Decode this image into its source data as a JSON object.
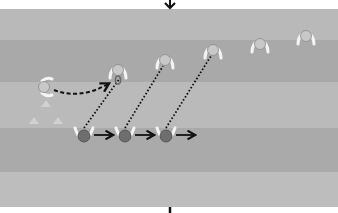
{
  "diagram": {
    "type": "sports-drill",
    "background": "#ffffff",
    "field": {
      "x": 0,
      "y": 9,
      "width": 338,
      "height": 198,
      "stripes": [
        {
          "y": 9,
          "h": 31,
          "color": "#b9b9b9"
        },
        {
          "y": 40,
          "h": 42,
          "color": "#a9a9a9"
        },
        {
          "y": 82,
          "h": 46,
          "color": "#bababa"
        },
        {
          "y": 128,
          "h": 44,
          "color": "#aaaaaa"
        },
        {
          "y": 172,
          "h": 35,
          "color": "#bdbdbd"
        }
      ]
    },
    "colors": {
      "light_player": "#c8c8c8",
      "light_player_stroke": "#8a8a8a",
      "dark_player": "#6e6e6e",
      "dark_player_stroke": "#4a4a4a",
      "arm": "#f4f4f4",
      "ball": "#6a6a6a",
      "line": "#111111",
      "cone": "#d4d4d4"
    },
    "direction_arrow_top": {
      "icon": "arrow-down-icon",
      "x": 170,
      "y1": 0,
      "y2": 9
    },
    "direction_marker_bottom": {
      "icon": "bar-marker-icon",
      "x": 170,
      "y1": 207,
      "y2": 213
    },
    "light_players": [
      {
        "id": "passer",
        "x": 44,
        "y": 87,
        "facing": "right"
      },
      {
        "id": "receiver-ball",
        "x": 118,
        "y": 70,
        "facing": "down",
        "has_ball": true
      },
      {
        "id": "light-3",
        "x": 165,
        "y": 60,
        "facing": "down"
      },
      {
        "id": "light-4",
        "x": 213,
        "y": 50,
        "facing": "down"
      },
      {
        "id": "light-5",
        "x": 260,
        "y": 44,
        "facing": "down"
      },
      {
        "id": "light-6",
        "x": 306,
        "y": 36,
        "facing": "down"
      }
    ],
    "dark_players": [
      {
        "id": "dark-1",
        "x": 84,
        "y": 135
      },
      {
        "id": "dark-2",
        "x": 125,
        "y": 135
      },
      {
        "id": "dark-3",
        "x": 166,
        "y": 135
      }
    ],
    "cones": [
      {
        "x": 46,
        "y": 104
      },
      {
        "x": 34,
        "y": 121
      },
      {
        "x": 58,
        "y": 121
      }
    ],
    "pass_path": {
      "style": "dashed",
      "from": [
        54,
        90
      ],
      "ctrl": [
        80,
        100
      ],
      "to": [
        108,
        84
      ]
    },
    "run_paths": [
      {
        "style": "dotted",
        "from": [
          84,
          128
        ],
        "to": [
          120,
          78
        ]
      },
      {
        "style": "dotted",
        "from": [
          125,
          128
        ],
        "to": [
          163,
          66
        ]
      },
      {
        "style": "dotted",
        "from": [
          166,
          128
        ],
        "to": [
          211,
          56
        ]
      }
    ],
    "move_arrows": [
      {
        "from": [
          94,
          135
        ],
        "to": [
          112,
          135
        ]
      },
      {
        "from": [
          135,
          135
        ],
        "to": [
          153,
          135
        ]
      },
      {
        "from": [
          176,
          135
        ],
        "to": [
          194,
          135
        ]
      }
    ]
  }
}
